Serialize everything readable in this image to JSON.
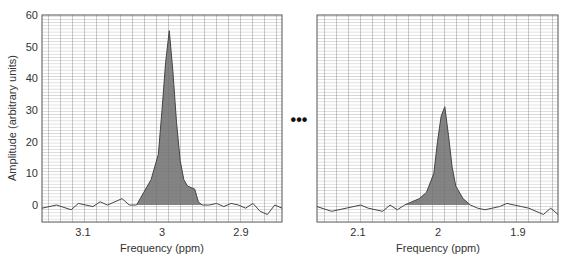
{
  "chart_data": [
    {
      "type": "area",
      "panel": "left",
      "title": "",
      "xlabel": "Frequency (ppm)",
      "ylabel": "Amplitude (arbitrary units)",
      "x_reversed": true,
      "xlim": [
        3.17,
        2.84
      ],
      "ylim": [
        -5,
        60
      ],
      "yticks": [
        0,
        10,
        20,
        30,
        40,
        50,
        60
      ],
      "xticks": [
        "3.1",
        "3",
        "2.9"
      ],
      "grid": true,
      "peak": {
        "x": 2.995,
        "y": 55
      },
      "x": [
        3.17,
        3.15,
        3.13,
        3.12,
        3.1,
        3.09,
        3.08,
        3.06,
        3.05,
        3.04,
        3.035,
        3.03,
        3.02,
        3.01,
        3.005,
        3.0,
        2.995,
        2.99,
        2.985,
        2.98,
        2.975,
        2.97,
        2.96,
        2.955,
        2.95,
        2.94,
        2.93,
        2.92,
        2.91,
        2.9,
        2.89,
        2.88,
        2.87,
        2.86,
        2.85,
        2.84
      ],
      "y": [
        -1,
        0,
        -1.5,
        0.5,
        -0.5,
        1,
        0,
        2,
        0,
        0,
        2,
        4,
        8,
        16,
        30,
        45,
        55,
        42,
        26,
        14,
        8,
        6,
        5,
        1,
        0,
        0,
        0.5,
        -0.5,
        0.5,
        0,
        -1,
        0.5,
        -2,
        -3,
        0,
        -1
      ]
    },
    {
      "type": "area",
      "panel": "right",
      "title": "",
      "xlabel": "Frequency (ppm)",
      "ylabel": "",
      "x_reversed": true,
      "xlim": [
        2.17,
        1.84
      ],
      "ylim": [
        -5,
        60
      ],
      "xticks": [
        "2.1",
        "2",
        "1.9"
      ],
      "grid": true,
      "peak": {
        "x": 1.995,
        "y": 31
      },
      "x": [
        2.17,
        2.15,
        2.13,
        2.11,
        2.1,
        2.08,
        2.07,
        2.06,
        2.05,
        2.04,
        2.03,
        2.02,
        2.01,
        2.005,
        2.0,
        1.995,
        1.99,
        1.985,
        1.98,
        1.97,
        1.96,
        1.95,
        1.94,
        1.93,
        1.92,
        1.91,
        1.9,
        1.89,
        1.88,
        1.87,
        1.86,
        1.85,
        1.84
      ],
      "y": [
        -0.5,
        -2,
        -1,
        0,
        -1,
        -2,
        0,
        -1.5,
        0,
        1,
        2,
        4,
        10,
        20,
        28,
        31,
        22,
        12,
        6,
        2,
        0,
        -1,
        -1.5,
        -1,
        -0.5,
        0.5,
        0,
        -0.5,
        -1,
        -2,
        -3,
        -1,
        -3
      ]
    }
  ],
  "labels": {
    "ylabel": "Amplitude (arbitrary units)",
    "left_xlabel": "Frequency (ppm)",
    "right_xlabel": "Frequency (ppm)",
    "yticks": [
      "60",
      "50",
      "40",
      "30",
      "20",
      "10",
      "0"
    ],
    "left_xticks": [
      "3.1",
      "3",
      "2.9"
    ],
    "right_xticks": [
      "2.1",
      "2",
      "1.9"
    ],
    "ellipsis": "•••"
  }
}
